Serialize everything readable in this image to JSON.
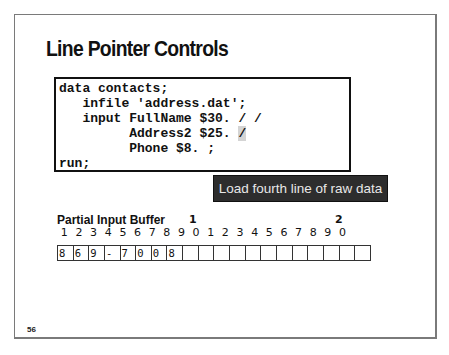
{
  "slide": {
    "title": "Line Pointer Controls",
    "page_number": "56"
  },
  "code": {
    "lines": [
      "data contacts;",
      "   infile 'address.dat';",
      "   input FullName $30. / /",
      "         Address2 $25. ",
      "         Phone $8. ;",
      "run;"
    ],
    "highlighted_token": "/"
  },
  "tooltip": {
    "text": "Load fourth line of raw data"
  },
  "buffer": {
    "label": "Partial Input Buffer",
    "tens_markers": [
      "1",
      "2"
    ],
    "column_digits": [
      "1",
      "2",
      "3",
      "4",
      "5",
      "6",
      "7",
      "8",
      "9",
      "0",
      "1",
      "2",
      "3",
      "4",
      "5",
      "6",
      "7",
      "8",
      "9",
      "0"
    ],
    "cells": [
      "8",
      "6",
      "9",
      "-",
      "7",
      "0",
      "0",
      "8",
      "",
      "",
      "",
      "",
      "",
      "",
      "",
      "",
      "",
      "",
      "",
      ""
    ]
  }
}
